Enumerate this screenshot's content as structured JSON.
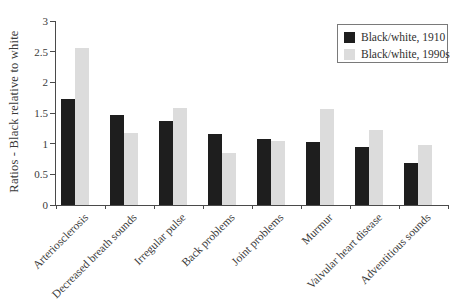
{
  "figure": {
    "background": "#ffffff",
    "text_color": "#3a3a3a",
    "axis_color": "#4a4a4a"
  },
  "chart_data": {
    "type": "bar",
    "title": "",
    "ylabel": "Ratios - Black relative to white",
    "xlabel": "",
    "ylim": [
      0,
      3
    ],
    "yticks": [
      0,
      0.5,
      1,
      1.5,
      2,
      2.5,
      3
    ],
    "grid": false,
    "legend_position": "top-right",
    "categories": [
      "Arteriosclerosis",
      "Decreased breath sounds",
      "Irregular pulse",
      "Back problems",
      "Joint problems",
      "Murmur",
      "Valvular heart disease",
      "Adventitious sounds"
    ],
    "series": [
      {
        "name": "Black/white, 1910",
        "color": "#1e1e1e",
        "values": [
          1.73,
          1.46,
          1.37,
          1.15,
          1.08,
          1.02,
          0.94,
          0.68
        ]
      },
      {
        "name": "Black/white, 1990s",
        "color": "#dcdcdc",
        "values": [
          2.56,
          1.18,
          1.58,
          0.84,
          1.04,
          1.56,
          1.22,
          0.98
        ]
      }
    ]
  }
}
